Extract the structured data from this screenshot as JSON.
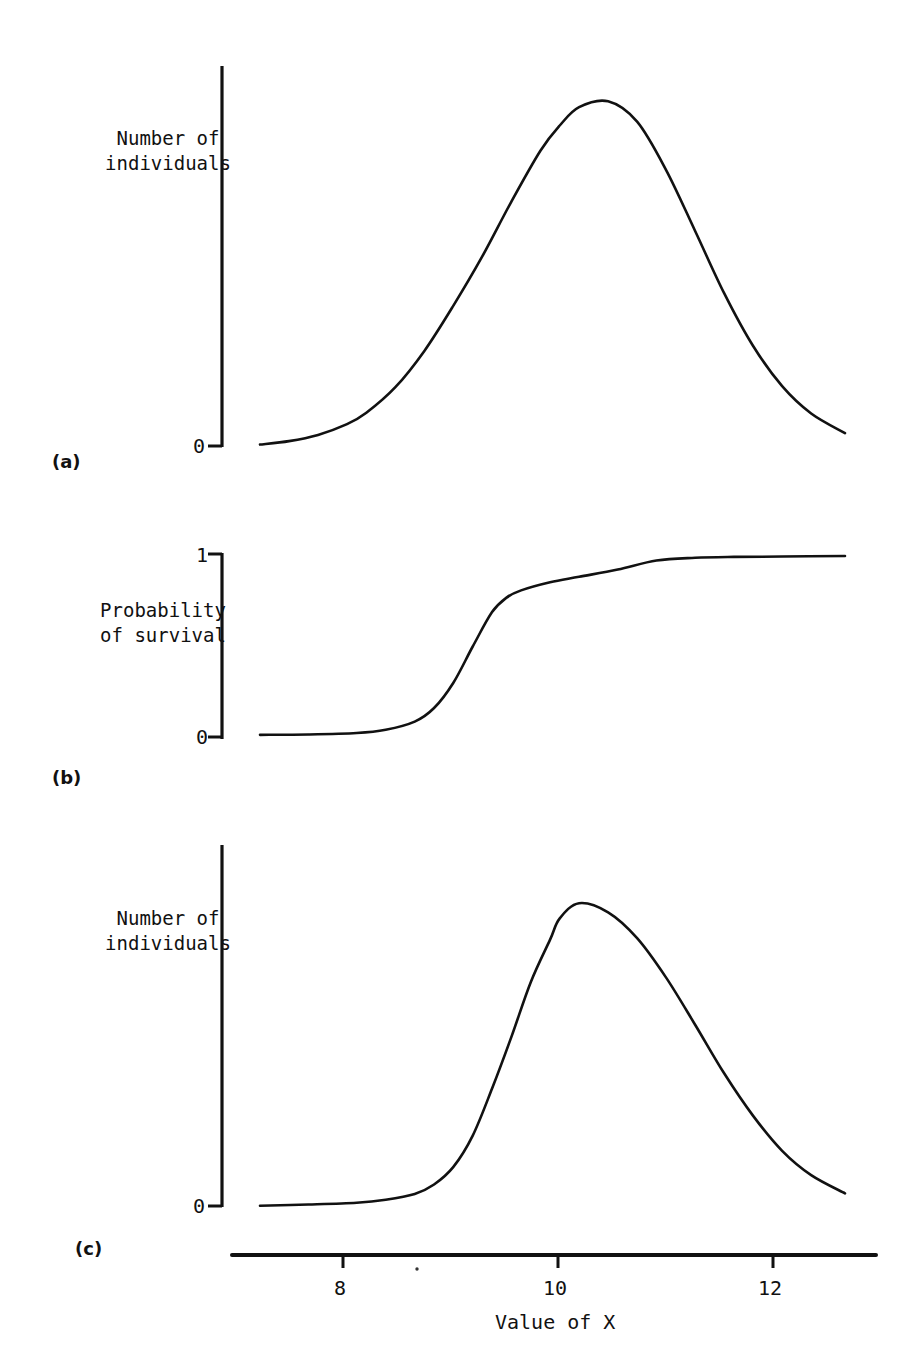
{
  "figure": {
    "panels": [
      {
        "id": "a",
        "label": "(a)",
        "y_axis_label_line1": "Number of",
        "y_axis_label_line2": "individuals",
        "y_ticks": [
          "0"
        ]
      },
      {
        "id": "b",
        "label": "(b)",
        "y_axis_label_line1": "Probability",
        "y_axis_label_line2": "of survival",
        "y_ticks": [
          "1",
          "0"
        ]
      },
      {
        "id": "c",
        "label": "(c)",
        "y_axis_label_line1": "Number of",
        "y_axis_label_line2": "individuals",
        "y_ticks": [
          "0"
        ]
      }
    ],
    "x_axis": {
      "title": "Value of X",
      "tick_labels": [
        "8",
        "10",
        "12"
      ],
      "tick_values": [
        8,
        10,
        12
      ],
      "range": [
        6.9,
        12.95
      ]
    },
    "colors": {
      "ink": "#111111",
      "background": "#ffffff"
    }
  },
  "chart_data": [
    {
      "type": "line",
      "panel": "a",
      "title": "",
      "xlabel": "Value of X",
      "ylabel": "Number of individuals",
      "xlim": [
        6.9,
        12.95
      ],
      "ylim": [
        0,
        1.05
      ],
      "grid": false,
      "legend": "none",
      "ytick_labels": [
        "0"
      ],
      "ytick_values": [
        0
      ],
      "description": "Symmetric normal distribution of X in the population, centred at X = 10",
      "curve": {
        "form": "gaussian",
        "mean": 10.0,
        "sigma": 1.05,
        "peak_height": 1.0
      },
      "x": [
        6.9,
        7.2,
        7.5,
        7.8,
        8.0,
        8.3,
        8.6,
        8.9,
        9.2,
        9.5,
        9.8,
        10.0,
        10.2,
        10.5,
        10.8,
        11.1,
        11.4,
        11.7,
        12.0,
        12.3,
        12.6,
        12.95
      ],
      "y": [
        0.007,
        0.017,
        0.035,
        0.066,
        0.099,
        0.173,
        0.278,
        0.409,
        0.552,
        0.71,
        0.857,
        0.93,
        0.983,
        1.0,
        0.941,
        0.801,
        0.625,
        0.445,
        0.292,
        0.176,
        0.097,
        0.04
      ]
    },
    {
      "type": "line",
      "panel": "b",
      "title": "",
      "xlabel": "Value of X",
      "ylabel": "Probability of survival",
      "xlim": [
        6.9,
        12.95
      ],
      "ylim": [
        0,
        1.0
      ],
      "grid": false,
      "legend": "none",
      "ytick_labels": [
        "1",
        "0"
      ],
      "ytick_values": [
        1,
        0
      ],
      "description": "Probability of survival rises steeply between X = 8.5 and X = 9.5, then levels off at 1",
      "x": [
        6.9,
        7.4,
        7.9,
        8.2,
        8.5,
        8.7,
        8.9,
        9.1,
        9.3,
        9.45,
        9.6,
        9.9,
        10.2,
        10.6,
        11.0,
        11.4,
        11.8,
        12.3,
        12.95
      ],
      "y": [
        0.012,
        0.014,
        0.022,
        0.04,
        0.085,
        0.16,
        0.3,
        0.5,
        0.69,
        0.77,
        0.81,
        0.855,
        0.885,
        0.925,
        0.975,
        0.99,
        0.995,
        0.997,
        1.0
      ]
    },
    {
      "type": "line",
      "panel": "c",
      "title": "",
      "xlabel": "Value of X",
      "ylabel": "Number of individuals",
      "xlim": [
        6.9,
        12.95
      ],
      "ylim": [
        0,
        1.05
      ],
      "grid": false,
      "legend": "none",
      "ytick_labels": [
        "0"
      ],
      "ytick_values": [
        0
      ],
      "description": "Distribution of X among survivors: product of panel (a) and panel (b); right-skewed with peak at X = 10",
      "x": [
        6.9,
        7.4,
        7.9,
        8.2,
        8.5,
        8.7,
        8.9,
        9.1,
        9.3,
        9.5,
        9.7,
        9.9,
        10.0,
        10.2,
        10.5,
        10.8,
        11.1,
        11.4,
        11.7,
        12.0,
        12.3,
        12.6,
        12.95
      ],
      "y": [
        0.004,
        0.008,
        0.014,
        0.024,
        0.043,
        0.074,
        0.132,
        0.235,
        0.39,
        0.56,
        0.74,
        0.88,
        0.95,
        1.0,
        0.97,
        0.885,
        0.755,
        0.6,
        0.44,
        0.3,
        0.185,
        0.105,
        0.045
      ]
    }
  ]
}
